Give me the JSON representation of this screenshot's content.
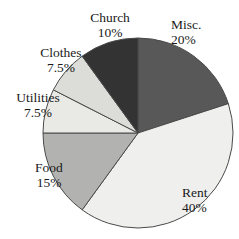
{
  "chart_data": {
    "type": "pie",
    "title": "",
    "subtitle": "",
    "xlabel": "",
    "ylabel": "",
    "legend_position": "none",
    "grid": false,
    "labels_show_percent": true,
    "start_angle_deg": 0,
    "direction": "clockwise",
    "categories": [
      "Misc.",
      "Rent",
      "Food",
      "Utilities",
      "Clothes",
      "Church"
    ],
    "values": [
      20,
      40,
      15,
      7.5,
      7.5,
      10
    ],
    "units": "%",
    "total": 100,
    "slices": [
      {
        "name": "Misc.",
        "value": 20,
        "percent_label": "20%",
        "color": "#585858",
        "start_deg": 0,
        "end_deg": 72,
        "label_name": "Misc.",
        "label_pct": "20%"
      },
      {
        "name": "Rent",
        "value": 40,
        "percent_label": "40%",
        "color": "#efefed",
        "start_deg": 72,
        "end_deg": 216,
        "label_name": "Rent",
        "label_pct": "40%"
      },
      {
        "name": "Food",
        "value": 15,
        "percent_label": "15%",
        "color": "#b2b2b0",
        "start_deg": 216,
        "end_deg": 270,
        "label_name": "Food",
        "label_pct": "15%"
      },
      {
        "name": "Utilities",
        "value": 7.5,
        "percent_label": "7.5%",
        "color": "#e9e9e6",
        "start_deg": 270,
        "end_deg": 297,
        "label_name": "Utilities",
        "label_pct": "7.5%"
      },
      {
        "name": "Clothes",
        "value": 7.5,
        "percent_label": "7.5%",
        "color": "#dcdcd8",
        "start_deg": 297,
        "end_deg": 324,
        "label_name": "Clothes",
        "label_pct": "7.5%"
      },
      {
        "name": "Church",
        "value": 10,
        "percent_label": "10%",
        "color": "#333333",
        "start_deg": 324,
        "end_deg": 360,
        "label_name": "Church",
        "label_pct": "10%"
      }
    ],
    "geometry": {
      "center_x": 138,
      "center_y": 133,
      "radius": 95
    },
    "style": {
      "background": "#ffffff",
      "outline_color": "#4a4a4a",
      "text_color": "#1a1a1a"
    }
  }
}
